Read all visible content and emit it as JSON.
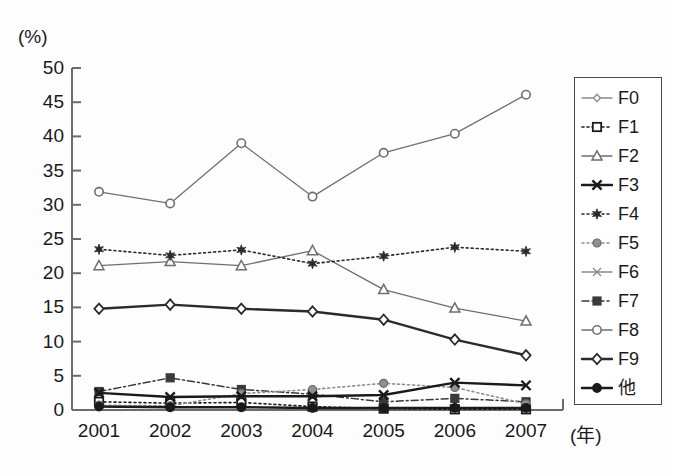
{
  "axis": {
    "unit_label": "(%)",
    "x_unit_label": "(年)",
    "y_ticks": [
      "0",
      "5",
      "10",
      "15",
      "20",
      "25",
      "30",
      "35",
      "40",
      "45",
      "50"
    ],
    "x_ticks": [
      "2001",
      "2002",
      "2003",
      "2004",
      "2005",
      "2006",
      "2007"
    ]
  },
  "legend": {
    "items": [
      {
        "label": "F0",
        "marker": "open-diamond-small",
        "line": "solid-thin",
        "color": "#8a8a8a"
      },
      {
        "label": "F1",
        "marker": "open-square",
        "line": "dotted",
        "color": "#1a1a1a"
      },
      {
        "label": "F2",
        "marker": "open-triangle",
        "line": "solid-thin",
        "color": "#6e6e6e"
      },
      {
        "label": "F3",
        "marker": "x-cross",
        "line": "solid-bold",
        "color": "#1a1a1a"
      },
      {
        "label": "F4",
        "marker": "star",
        "line": "dotted",
        "color": "#2b2b2b"
      },
      {
        "label": "F5",
        "marker": "filled-circle-gray",
        "line": "dotted",
        "color": "#909090"
      },
      {
        "label": "F6",
        "marker": "x-cross-thin",
        "line": "solid-thin",
        "color": "#8a8a8a"
      },
      {
        "label": "F7",
        "marker": "filled-square",
        "line": "dash-dot",
        "color": "#3a3a3a"
      },
      {
        "label": "F8",
        "marker": "open-circle",
        "line": "solid-thin",
        "color": "#707070"
      },
      {
        "label": "F9",
        "marker": "open-diamond",
        "line": "solid-bold",
        "color": "#2b2b2b"
      },
      {
        "label": "他",
        "marker": "filled-circle",
        "line": "solid-bold",
        "color": "#1a1a1a"
      }
    ]
  },
  "caption": "",
  "chart_data": {
    "type": "line",
    "title": "",
    "xlabel": "(年)",
    "ylabel": "(%)",
    "ylim": [
      0,
      50
    ],
    "ytick_step": 5,
    "grid": false,
    "legend_position": "right",
    "categories": [
      "2001",
      "2002",
      "2003",
      "2004",
      "2005",
      "2006",
      "2007"
    ],
    "series": [
      {
        "name": "F0",
        "values": [
          0.6,
          0.5,
          0.5,
          0.3,
          0.2,
          0.2,
          0.2
        ]
      },
      {
        "name": "F1",
        "values": [
          1.2,
          1.0,
          1.1,
          0.5,
          0.2,
          0.1,
          0.1
        ]
      },
      {
        "name": "F2",
        "values": [
          21.1,
          21.7,
          21.1,
          23.3,
          17.6,
          14.9,
          13.0
        ]
      },
      {
        "name": "F3",
        "values": [
          2.5,
          1.9,
          2.0,
          2.0,
          2.2,
          4.0,
          3.6
        ]
      },
      {
        "name": "F4",
        "values": [
          23.5,
          22.6,
          23.4,
          21.4,
          22.5,
          23.8,
          23.2
        ]
      },
      {
        "name": "F5",
        "values": [
          0.7,
          0.6,
          2.4,
          3.0,
          3.9,
          3.3,
          0.9
        ]
      },
      {
        "name": "F6",
        "values": [
          0.5,
          0.4,
          0.4,
          0.3,
          0.2,
          0.2,
          0.2
        ]
      },
      {
        "name": "F7",
        "values": [
          2.7,
          4.7,
          3.0,
          2.3,
          1.2,
          1.7,
          1.2
        ]
      },
      {
        "name": "F8",
        "values": [
          31.9,
          30.2,
          39.0,
          31.2,
          37.6,
          40.4,
          46.1
        ]
      },
      {
        "name": "F9",
        "values": [
          14.8,
          15.4,
          14.8,
          14.4,
          13.2,
          10.3,
          8.0
        ]
      },
      {
        "name": "他",
        "values": [
          0.5,
          0.4,
          0.4,
          0.3,
          0.3,
          0.3,
          0.3
        ]
      }
    ]
  }
}
